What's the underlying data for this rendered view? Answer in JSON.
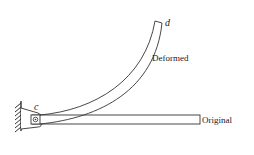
{
  "diagram": {
    "labels": {
      "point_c": "c",
      "point_d": "d",
      "deformed": "Deformed",
      "original": "Original"
    },
    "colors": {
      "stroke": "#333333",
      "background": "#ffffff"
    }
  }
}
